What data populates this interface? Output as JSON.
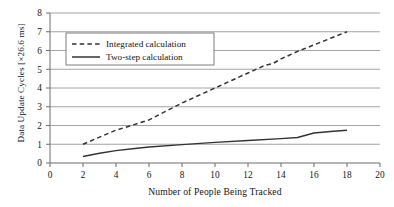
{
  "chart_data": {
    "type": "line",
    "title": "",
    "xlabel": "Number of People Being Tracked",
    "ylabel": "Data Update Cycles [×26.6 ms]",
    "xlim": [
      0,
      20
    ],
    "ylim": [
      0,
      8
    ],
    "xticks": [
      "0",
      "2",
      "4",
      "6",
      "8",
      "10",
      "12",
      "14",
      "16",
      "18",
      "20"
    ],
    "yticks": [
      "0",
      "1",
      "2",
      "3",
      "4",
      "5",
      "6",
      "7",
      "8"
    ],
    "grid": "horizontal",
    "legend_position": "upper-left-inside",
    "series": [
      {
        "name": "Integrated calculation",
        "style": "dashed",
        "color": "#333333",
        "x": [
          2,
          3,
          4,
          5,
          6,
          7,
          8,
          9,
          10,
          11,
          12,
          13,
          13.5,
          14,
          15,
          16,
          17,
          18
        ],
        "values": [
          1.0,
          1.38,
          1.75,
          2.02,
          2.3,
          2.75,
          3.2,
          3.6,
          4.0,
          4.4,
          4.8,
          5.2,
          5.3,
          5.55,
          5.95,
          6.3,
          6.65,
          7.0
        ]
      },
      {
        "name": "Two-step calculation",
        "style": "solid",
        "color": "#333333",
        "x": [
          2,
          3,
          4,
          5,
          6,
          8,
          10,
          12,
          14,
          15,
          16,
          17,
          18
        ],
        "values": [
          0.35,
          0.52,
          0.66,
          0.76,
          0.85,
          0.98,
          1.1,
          1.2,
          1.3,
          1.36,
          1.6,
          1.68,
          1.75
        ]
      }
    ]
  },
  "legend": {
    "entries": [
      {
        "label": "Integrated calculation",
        "style": "dashed"
      },
      {
        "label": "Two-step calculation",
        "style": "solid"
      }
    ]
  }
}
